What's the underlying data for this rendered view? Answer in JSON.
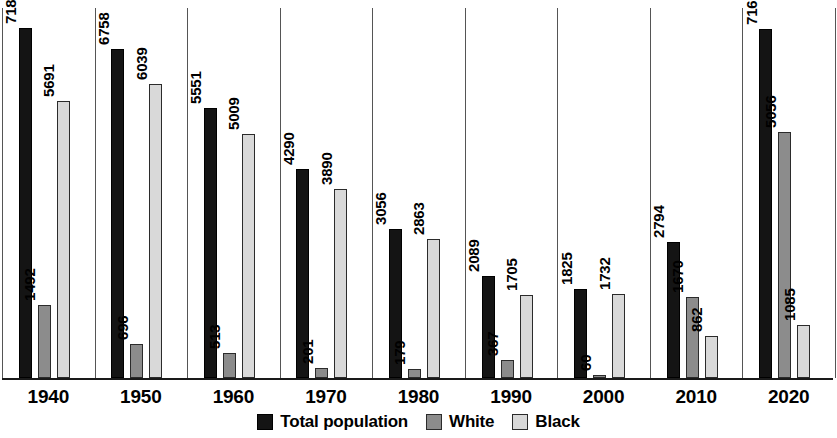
{
  "chart_data": {
    "type": "bar",
    "title": "",
    "subtitle": "",
    "xlabel": "",
    "ylabel": "",
    "grid": false,
    "legend_position": "bottom-center",
    "ylim": [
      0,
      7600
    ],
    "categories": [
      "1940",
      "1950",
      "1960",
      "1970",
      "1980",
      "1990",
      "2000",
      "2010",
      "2020"
    ],
    "series": [
      {
        "name": "Total population",
        "color": "#141414",
        "values": [
          7183,
          6758,
          5551,
          4290,
          3056,
          2089,
          1825,
          2794,
          7167
        ]
      },
      {
        "name": "White",
        "color": "#8c8c8c",
        "values": [
          1492,
          696,
          513,
          201,
          179,
          367,
          60,
          1670,
          5056
        ]
      },
      {
        "name": "Black",
        "color": "#d9d9d9",
        "values": [
          5691,
          6039,
          5009,
          3890,
          2863,
          1705,
          1732,
          862,
          1085
        ]
      }
    ]
  },
  "legend": {
    "items": [
      {
        "label": "Total population",
        "swatch": "total"
      },
      {
        "label": "White",
        "swatch": "white"
      },
      {
        "label": "Black",
        "swatch": "black"
      }
    ]
  },
  "axis": {
    "ticks": [
      "1940",
      "1950",
      "1960",
      "1970",
      "1980",
      "1990",
      "2000",
      "2010",
      "2020"
    ]
  }
}
